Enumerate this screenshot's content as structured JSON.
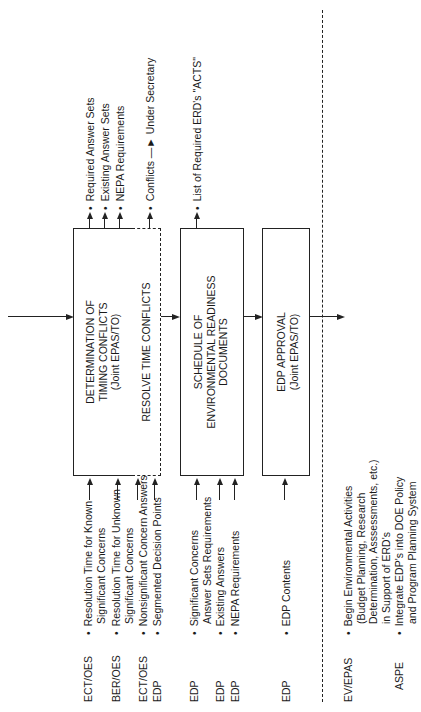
{
  "boxes": {
    "determination": {
      "line1": "DETERMINATION OF",
      "line2": "TIMING CONFLICTS",
      "line3": "(Joint EPAS/TO)"
    },
    "resolve": {
      "line1": "RESOLVE TIME CONFLICTS"
    },
    "schedule": {
      "line1": "SCHEDULE OF",
      "line2": "ENVIRONMENTAL READINESS",
      "line3": "DOCUMENTS"
    },
    "approval": {
      "line1": "EDP APPROVAL",
      "line2": "(Joint EPAS/TO)"
    }
  },
  "inputs": [
    {
      "org": "ECT/OES",
      "text": "Resolution Time for Known",
      "text2": "Significant Concerns"
    },
    {
      "org": "BER/OES",
      "text": "Resolution Time for Unknown",
      "text2": "Significant Concerns"
    },
    {
      "org": "ECT/OES",
      "text": "Nonsignificant Concern Answers"
    },
    {
      "org": "EDP",
      "text": "Segmented Decision Points"
    },
    {
      "org": "EDP",
      "text": "Significant Concerns",
      "text2": "Answer Sets Requirements"
    },
    {
      "org": "EDP",
      "text": "Existing Answers"
    },
    {
      "org": "EDP",
      "text": "NEPA Requirements"
    },
    {
      "org": "EDP",
      "text": "EDP Contents"
    }
  ],
  "outputs": {
    "determination": [
      "Required Answer Sets",
      "Existing Answer Sets",
      "NEPA Requirements"
    ],
    "resolve": {
      "text": "Conflicts",
      "arrow_target": "Under Secretary"
    },
    "schedule": [
      "List of Required ERD's \"ACTS\""
    ]
  },
  "results": [
    {
      "org": "EV/EPAS",
      "lines": [
        "Begin Environmental Activities",
        "(Budget Planning, Research",
        "Determination, Asssessments, etc.)",
        "in Support of ERD's"
      ]
    },
    {
      "org": "ASPE",
      "lines": [
        "Integrate EDP's into DOE Policy",
        "and Program Planning System"
      ]
    }
  ]
}
